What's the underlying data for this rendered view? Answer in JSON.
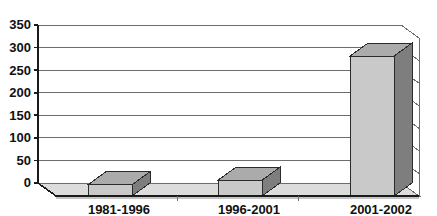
{
  "chart_data": {
    "type": "bar",
    "title": "",
    "subtitle": "",
    "xlabel": "",
    "ylabel": "",
    "categories": [
      "1981-1996",
      "1996-2001",
      "2001-2002"
    ],
    "values": [
      25,
      35,
      310
    ],
    "series": [
      {
        "name": "series-1",
        "values": [
          25,
          35,
          310
        ]
      }
    ],
    "ylim": [
      0,
      350
    ],
    "yticks": [
      0,
      50,
      100,
      150,
      200,
      250,
      300,
      350
    ],
    "ytick_labels": [
      "0",
      "50",
      "100",
      "150",
      "200",
      "250",
      "300",
      "350"
    ],
    "grid": true,
    "grid_axis": "y",
    "legend": false,
    "legend_position": "none",
    "style": "3d-bar",
    "annotations": []
  },
  "colors": {
    "bar_front": "#c9c9c9",
    "bar_side": "#7e7e7e",
    "bar_top": "#ababab",
    "bar_outline": "#2b2b2b",
    "floor": "#dcdcdc",
    "floor_side": "#c4c4c4",
    "wall": "#ffffff",
    "gridline": "#6d6d6d",
    "axis": "#1a1a1a",
    "text": "#111111",
    "background": "#ffffff"
  },
  "geometry": {
    "plot_left": 38,
    "plot_right": 419,
    "plot_top": 25,
    "plot_baseline": 183,
    "depth_x": 18,
    "depth_y": 13,
    "px_per_unit": 0.4514,
    "bar_width": 44,
    "bar_centers": [
      110,
      240,
      372
    ]
  }
}
